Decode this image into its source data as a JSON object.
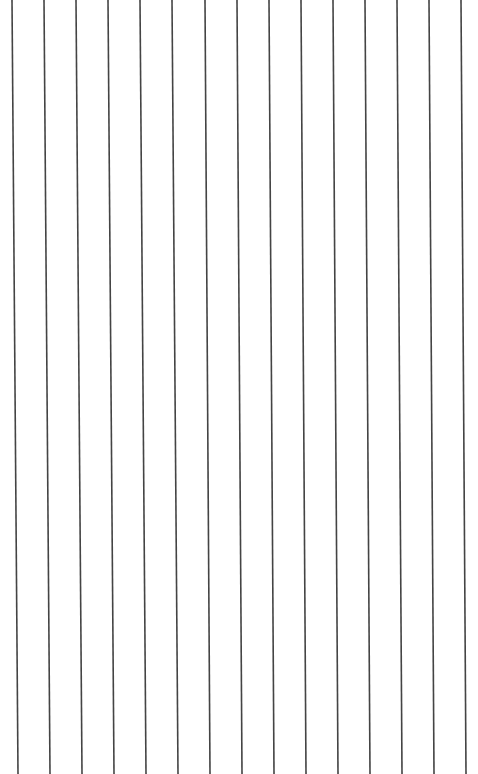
{
  "page": {
    "background": "#ffffff",
    "line_color": "#444444",
    "line_width": 1.6,
    "height": 774,
    "lines": [
      {
        "x_top": 12,
        "x_bottom": 18
      },
      {
        "x_top": 44,
        "x_bottom": 50
      },
      {
        "x_top": 76,
        "x_bottom": 82
      },
      {
        "x_top": 108,
        "x_bottom": 114
      },
      {
        "x_top": 140,
        "x_bottom": 146
      },
      {
        "x_top": 172,
        "x_bottom": 178
      },
      {
        "x_top": 205,
        "x_bottom": 210
      },
      {
        "x_top": 237,
        "x_bottom": 242
      },
      {
        "x_top": 269,
        "x_bottom": 274
      },
      {
        "x_top": 301,
        "x_bottom": 306
      },
      {
        "x_top": 333,
        "x_bottom": 338
      },
      {
        "x_top": 365,
        "x_bottom": 370
      },
      {
        "x_top": 397,
        "x_bottom": 402
      },
      {
        "x_top": 429,
        "x_bottom": 434
      },
      {
        "x_top": 461,
        "x_bottom": 466
      }
    ]
  }
}
